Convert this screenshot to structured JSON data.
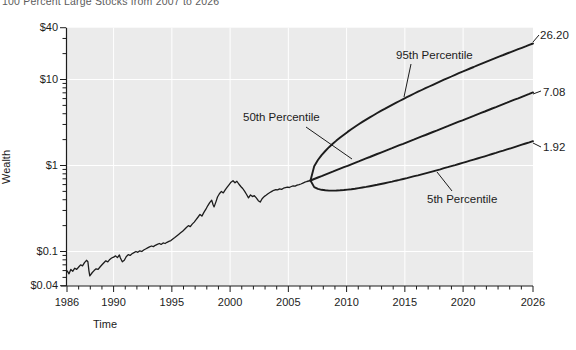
{
  "title": "100 Percent Large Stocks from 2007 to 2026",
  "axes": {
    "x_title": "Time",
    "y_title": "Wealth"
  },
  "annotations": {
    "p95": {
      "label": "95th Percentile",
      "end_label": "26.20"
    },
    "p50": {
      "label": "50th Percentile",
      "end_label": "7.08"
    },
    "p5": {
      "label": "5th Percentile",
      "end_label": "1.92"
    }
  },
  "colors": {
    "plot_background": "#ebebeb",
    "gridline": "#ffffff",
    "axis": "#1c1c1c",
    "series": "#1c1c1c",
    "tick_label": "#1c1c1c"
  },
  "chart_data": {
    "type": "line",
    "title": "100 Percent Large Stocks from 2007 to 2026",
    "xlabel": "Time",
    "ylabel": "Wealth",
    "x_range": [
      1986,
      2026
    ],
    "y_range": [
      0.04,
      40
    ],
    "y_scale": "log",
    "grid": "on",
    "x_major_ticks": [
      1986,
      1990,
      1995,
      2000,
      2005,
      2010,
      2015,
      2020,
      2026
    ],
    "y_major_ticks": [
      {
        "value": 40,
        "label": "$40"
      },
      {
        "value": 10,
        "label": "$10"
      },
      {
        "value": 1,
        "label": "$1"
      },
      {
        "value": 0.1,
        "label": "$0.1"
      },
      {
        "value": 0.04,
        "label": "$0.04"
      }
    ],
    "gridline_years": [
      1990,
      1995,
      2000,
      2005,
      2010,
      2015,
      2020
    ],
    "gridline_values": [
      10,
      1,
      0.1
    ],
    "historical": {
      "name": "Historical wealth of large stocks",
      "x": [
        1986.0,
        1986.17,
        1986.33,
        1986.5,
        1986.67,
        1986.83,
        1987.0,
        1987.17,
        1987.33,
        1987.5,
        1987.67,
        1987.79,
        1987.88,
        1987.96,
        1988.17,
        1988.33,
        1988.5,
        1988.67,
        1988.83,
        1989.0,
        1989.17,
        1989.33,
        1989.5,
        1989.67,
        1989.83,
        1990.0,
        1990.17,
        1990.33,
        1990.5,
        1990.58,
        1990.75,
        1990.92,
        1991.08,
        1991.25,
        1991.42,
        1991.58,
        1991.75,
        1991.92,
        1992.08,
        1992.25,
        1992.42,
        1992.58,
        1992.75,
        1992.92,
        1993.08,
        1993.25,
        1993.42,
        1993.58,
        1993.75,
        1993.92,
        1994.08,
        1994.25,
        1994.42,
        1994.58,
        1994.75,
        1994.92,
        1995.08,
        1995.25,
        1995.42,
        1995.58,
        1995.75,
        1995.92,
        1996.08,
        1996.25,
        1996.42,
        1996.58,
        1996.75,
        1996.92,
        1997.08,
        1997.25,
        1997.42,
        1997.58,
        1997.75,
        1997.92,
        1998.08,
        1998.25,
        1998.42,
        1998.54,
        1998.63,
        1998.79,
        1998.92,
        1999.08,
        1999.25,
        1999.42,
        1999.58,
        1999.75,
        1999.92,
        2000.08,
        2000.25,
        2000.42,
        2000.58,
        2000.75,
        2000.92,
        2001.08,
        2001.25,
        2001.42,
        2001.58,
        2001.75,
        2001.92,
        2002.08,
        2002.25,
        2002.42,
        2002.58,
        2002.75,
        2002.92,
        2003.08,
        2003.25,
        2003.42,
        2003.58,
        2003.75,
        2003.92,
        2004.08,
        2004.25,
        2004.42,
        2004.58,
        2004.75,
        2004.92,
        2005.08,
        2005.25,
        2005.42,
        2005.58,
        2005.75,
        2005.92,
        2006.08,
        2006.25,
        2006.42,
        2006.58,
        2006.75,
        2006.9
      ],
      "y": [
        0.06,
        0.055,
        0.062,
        0.059,
        0.064,
        0.062,
        0.066,
        0.07,
        0.068,
        0.074,
        0.079,
        0.076,
        0.06,
        0.052,
        0.057,
        0.06,
        0.063,
        0.062,
        0.066,
        0.07,
        0.074,
        0.078,
        0.076,
        0.081,
        0.084,
        0.086,
        0.089,
        0.085,
        0.091,
        0.084,
        0.076,
        0.079,
        0.087,
        0.092,
        0.09,
        0.094,
        0.097,
        0.1,
        0.098,
        0.102,
        0.1,
        0.104,
        0.107,
        0.11,
        0.113,
        0.116,
        0.114,
        0.118,
        0.121,
        0.124,
        0.121,
        0.126,
        0.124,
        0.128,
        0.131,
        0.134,
        0.14,
        0.146,
        0.152,
        0.158,
        0.165,
        0.172,
        0.18,
        0.19,
        0.2,
        0.195,
        0.208,
        0.22,
        0.235,
        0.252,
        0.27,
        0.258,
        0.285,
        0.31,
        0.34,
        0.37,
        0.395,
        0.35,
        0.33,
        0.38,
        0.43,
        0.47,
        0.5,
        0.48,
        0.52,
        0.56,
        0.6,
        0.64,
        0.665,
        0.63,
        0.655,
        0.61,
        0.57,
        0.54,
        0.5,
        0.46,
        0.42,
        0.455,
        0.435,
        0.445,
        0.42,
        0.39,
        0.375,
        0.41,
        0.435,
        0.45,
        0.47,
        0.485,
        0.5,
        0.515,
        0.525,
        0.52,
        0.535,
        0.528,
        0.545,
        0.552,
        0.56,
        0.555,
        0.57,
        0.58,
        0.575,
        0.59,
        0.6,
        0.61,
        0.625,
        0.64,
        0.652,
        0.66,
        0.67
      ]
    },
    "projection": {
      "start_year": 2006.9,
      "end_year": 2026.0,
      "start_value": 0.67,
      "percentiles": [
        {
          "name": "95th Percentile",
          "end_value": 26.2,
          "log_linear": 0.355,
          "log_sqrt": 1.237
        },
        {
          "name": "50th Percentile",
          "end_value": 7.08,
          "log_linear": 1.024,
          "log_sqrt": 0
        },
        {
          "name": "5th Percentile",
          "end_value": 1.92,
          "log_linear": 1.214,
          "log_sqrt": -0.757
        }
      ]
    }
  }
}
